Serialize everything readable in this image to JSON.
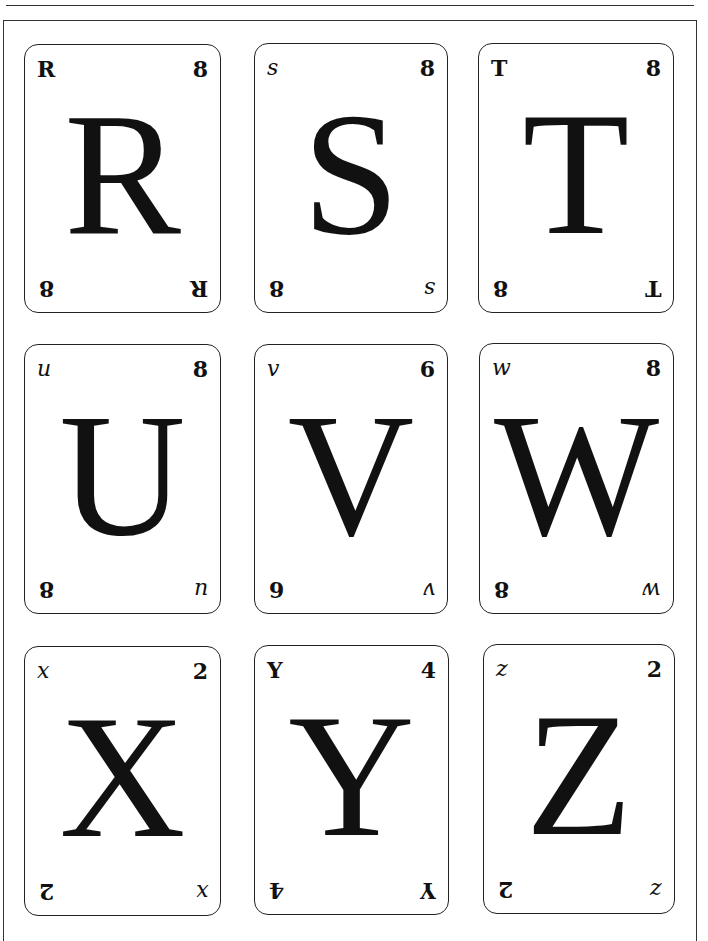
{
  "page": {
    "cards": [
      {
        "letter": "R",
        "corner_letter": "R",
        "number": "8"
      },
      {
        "letter": "S",
        "corner_letter": "s",
        "number": "8"
      },
      {
        "letter": "T",
        "corner_letter": "T",
        "number": "8"
      },
      {
        "letter": "U",
        "corner_letter": "u",
        "number": "8"
      },
      {
        "letter": "V",
        "corner_letter": "v",
        "number": "6"
      },
      {
        "letter": "W",
        "corner_letter": "w",
        "number": "8"
      },
      {
        "letter": "X",
        "corner_letter": "x",
        "number": "2"
      },
      {
        "letter": "Y",
        "corner_letter": "Y",
        "number": "4"
      },
      {
        "letter": "Z",
        "corner_letter": "z",
        "number": "2"
      }
    ]
  }
}
